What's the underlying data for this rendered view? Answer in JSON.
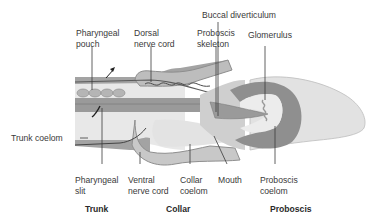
{
  "figure": {
    "colors": {
      "background": "#ffffff",
      "tissue_dark": "#8c8c8c",
      "tissue_mid": "#a9a9a9",
      "tissue_light": "#cfcfcf",
      "coelom": "#e6e6e6",
      "proboscis_skin": "#e2e2e2",
      "line": "#333333"
    }
  },
  "labels": {
    "pharyngeal_pouch": [
      "Pharyngeal",
      "pouch"
    ],
    "dorsal_nerve_cord": [
      "Dorsal",
      "nerve cord"
    ],
    "buccal_diverticulum": "Buccal diverticulum",
    "proboscis_skeleton": [
      "Proboscis",
      "skeleton"
    ],
    "glomerulus": "Glomerulus",
    "trunk_coelom": "Trunk coelom",
    "pharyngeal_slit": [
      "Pharyngeal",
      "slit"
    ],
    "ventral_nerve_cord": [
      "Ventral",
      "nerve cord"
    ],
    "collar_coelom": [
      "Collar",
      "coelom"
    ],
    "mouth": "Mouth",
    "proboscis_coelom": [
      "Proboscis",
      "coelom"
    ]
  },
  "regions": {
    "trunk": "Trunk",
    "collar": "Collar",
    "proboscis": "Proboscis"
  }
}
